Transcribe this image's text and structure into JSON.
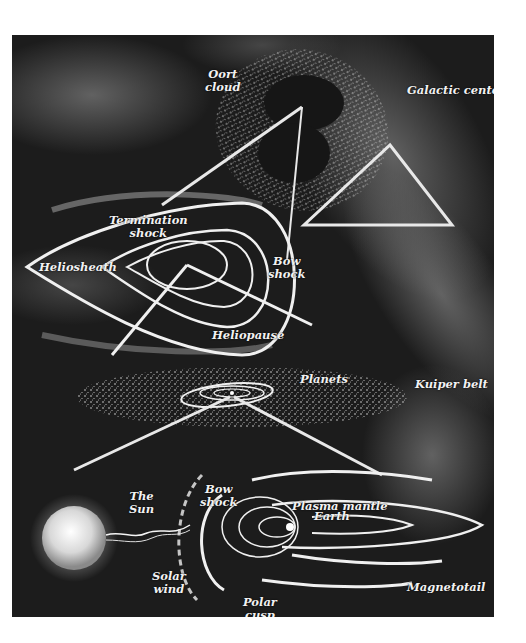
{
  "figure": {
    "panels": [
      {
        "id": "oort",
        "labels": [
          "Oort\ncloud",
          "Galactic center"
        ]
      },
      {
        "id": "heliosphere",
        "labels": [
          "Termination\nshock",
          "Heliosheath",
          "Bow\nshock",
          "Heliopause"
        ]
      },
      {
        "id": "solar-system",
        "labels": [
          "Planets",
          "Kuiper belt"
        ]
      },
      {
        "id": "magnetosphere",
        "labels": [
          "The\nSun",
          "Bow\nshock",
          "Plasma mantle",
          "Earth",
          "Solar\nwind",
          "Magnetotail",
          "Polar\ncusp"
        ]
      }
    ]
  },
  "labels": {
    "oort_cloud": "Oort\ncloud",
    "galactic_center": "Galactic center",
    "termination_shock": "Termination\nshock",
    "heliosheath": "Heliosheath",
    "bow_shock_helio": "Bow\nshock",
    "heliopause": "Heliopause",
    "planets": "Planets",
    "kuiper_belt": "Kuiper belt",
    "the_sun": "The\nSun",
    "bow_shock_earth": "Bow\nshock",
    "plasma_mantle": "Plasma mantle",
    "earth": "Earth",
    "solar_wind": "Solar\nwind",
    "magnetotail": "Magnetotail",
    "polar_cusp": "Polar\ncusp"
  },
  "colors": {
    "background": "#1c1c1c",
    "label": "#f2f2f2",
    "line": "#e8e8e8"
  }
}
